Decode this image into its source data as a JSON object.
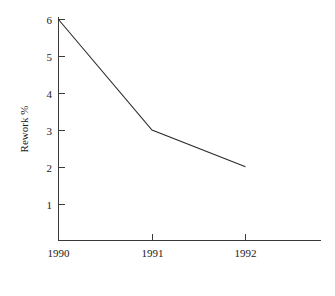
{
  "chart_data": {
    "type": "line",
    "title": "",
    "subtitle": "",
    "xlabel": "",
    "ylabel": "Rework %",
    "categories": [
      "1990",
      "1991",
      "1992"
    ],
    "x": [
      1990,
      1991,
      1992
    ],
    "values": [
      6,
      3,
      2
    ],
    "series": [
      {
        "name": "Rework %",
        "values": [
          6,
          3,
          2
        ]
      }
    ],
    "ylim": [
      0,
      6
    ],
    "xlim": [
      1990,
      1992
    ],
    "y_ticks": [
      "1",
      "2",
      "3",
      "4",
      "5",
      "6"
    ],
    "y_tick_values": [
      1,
      2,
      3,
      4,
      5,
      6
    ],
    "x_ticks": [
      "1990",
      "1991",
      "1992"
    ],
    "grid": false,
    "legend": false,
    "legend_position": "none",
    "markers": false,
    "annotations": []
  },
  "style": {
    "background_color": "#ffffff",
    "line_color": "#2b2b2b",
    "axis_color": "#3a3a3a",
    "text_color": "#1a1a1a"
  }
}
